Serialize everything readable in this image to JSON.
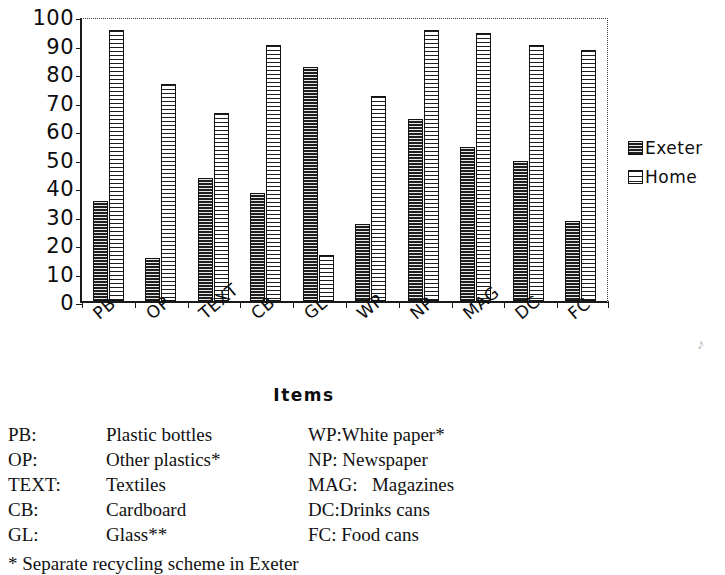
{
  "chart_data": {
    "type": "bar",
    "title": "",
    "xlabel": "Items",
    "ylabel": "",
    "ylim": [
      0,
      100
    ],
    "yticks": [
      0,
      10,
      20,
      30,
      40,
      50,
      60,
      70,
      80,
      90,
      100
    ],
    "ytick_labels": [
      "0",
      "10",
      "20",
      "30",
      "40",
      "50",
      "60",
      "70",
      "80",
      "90",
      "100"
    ],
    "grid": false,
    "legend_position": "right",
    "categories": [
      "PB",
      "OP",
      "TEXT",
      "CB",
      "GL",
      "WP",
      "NP",
      "MAG",
      "DC",
      "FC"
    ],
    "series": [
      {
        "name": "Exeter",
        "pattern": "horizontal-hatch",
        "values": [
          35,
          15,
          43,
          38,
          82,
          27,
          64,
          54,
          49,
          28
        ]
      },
      {
        "name": "Home",
        "pattern": "vertical-grid-hatch",
        "values": [
          95,
          76,
          66,
          90,
          16,
          72,
          95,
          94,
          90,
          88
        ]
      }
    ]
  },
  "legend": {
    "entries": [
      {
        "label": "Exeter",
        "swatch": "exeter-swatch"
      },
      {
        "label": "Home",
        "swatch": "home-swatch"
      }
    ]
  },
  "axis": {
    "x_title": "Items"
  },
  "abbreviation_key": {
    "rows": [
      {
        "left_abbr": "PB:",
        "left_term": "Plastic bottles",
        "right_abbr": "WP:",
        "right_term": "White paper*"
      },
      {
        "left_abbr": "OP:",
        "left_term": "Other plastics*",
        "right_abbr": "NP:",
        "right_term": " Newspaper"
      },
      {
        "left_abbr": "TEXT:",
        "left_term": "Textiles",
        "right_abbr": "MAG:",
        "right_term": "   Magazines"
      },
      {
        "left_abbr": "CB:",
        "left_term": "Cardboard",
        "right_abbr": "DC:",
        "right_term": "Drinks cans"
      },
      {
        "left_abbr": "GL:",
        "left_term": "Glass**",
        "right_abbr": "FC:",
        "right_term": " Food cans"
      }
    ],
    "footnote": "* Separate recycling scheme in Exeter"
  },
  "artifact": {
    "mark": "♪"
  }
}
